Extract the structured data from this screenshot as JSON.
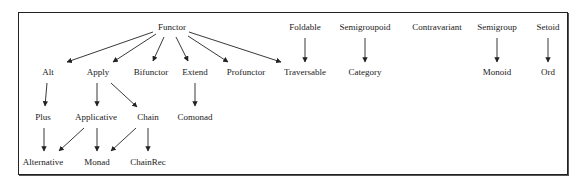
{
  "diagram": {
    "nodes": [
      {
        "id": "Functor",
        "label": "Functor",
        "x": 172,
        "y": 27
      },
      {
        "id": "Alt",
        "label": "Alt",
        "x": 48,
        "y": 72
      },
      {
        "id": "Apply",
        "label": "Apply",
        "x": 98,
        "y": 72
      },
      {
        "id": "Bifunctor",
        "label": "Bifunctor",
        "x": 151,
        "y": 72
      },
      {
        "id": "Extend",
        "label": "Extend",
        "x": 195,
        "y": 72
      },
      {
        "id": "Profunctor",
        "label": "Profunctor",
        "x": 246,
        "y": 72
      },
      {
        "id": "Traversable",
        "label": "Traversable",
        "x": 305,
        "y": 72
      },
      {
        "id": "Foldable",
        "label": "Foldable",
        "x": 305,
        "y": 27
      },
      {
        "id": "Semigroupoid",
        "label": "Semigroupoid",
        "x": 365,
        "y": 27
      },
      {
        "id": "Contravariant",
        "label": "Contravariant",
        "x": 437,
        "y": 27
      },
      {
        "id": "Semigroup",
        "label": "Semigroup",
        "x": 497,
        "y": 27
      },
      {
        "id": "Setoid",
        "label": "Setoid",
        "x": 548,
        "y": 27
      },
      {
        "id": "Category",
        "label": "Category",
        "x": 365,
        "y": 72
      },
      {
        "id": "Monoid",
        "label": "Monoid",
        "x": 497,
        "y": 72
      },
      {
        "id": "Ord",
        "label": "Ord",
        "x": 548,
        "y": 72
      },
      {
        "id": "Plus",
        "label": "Plus",
        "x": 43,
        "y": 117
      },
      {
        "id": "Applicative",
        "label": "Applicative",
        "x": 96,
        "y": 117
      },
      {
        "id": "Chain",
        "label": "Chain",
        "x": 148,
        "y": 117
      },
      {
        "id": "Comonad",
        "label": "Comonad",
        "x": 195,
        "y": 117
      },
      {
        "id": "Alternative",
        "label": "Alternative",
        "x": 43,
        "y": 162
      },
      {
        "id": "Monad",
        "label": "Monad",
        "x": 97,
        "y": 162
      },
      {
        "id": "ChainRec",
        "label": "ChainRec",
        "x": 148,
        "y": 162
      }
    ],
    "edges": [
      {
        "from": "Functor",
        "to": "Alt",
        "x1": 153,
        "y1": 32,
        "x2": 67,
        "y2": 62
      },
      {
        "from": "Functor",
        "to": "Apply",
        "x1": 156,
        "y1": 34,
        "x2": 113,
        "y2": 62
      },
      {
        "from": "Functor",
        "to": "Bifunctor",
        "x1": 164,
        "y1": 37,
        "x2": 153,
        "y2": 61
      },
      {
        "from": "Functor",
        "to": "Extend",
        "x1": 176,
        "y1": 37,
        "x2": 188,
        "y2": 61
      },
      {
        "from": "Functor",
        "to": "Profunctor",
        "x1": 188,
        "y1": 36,
        "x2": 228,
        "y2": 62
      },
      {
        "from": "Functor",
        "to": "Traversable",
        "x1": 189,
        "y1": 32,
        "x2": 281,
        "y2": 62
      },
      {
        "from": "Foldable",
        "to": "Traversable",
        "x1": 305,
        "y1": 38,
        "x2": 305,
        "y2": 62
      },
      {
        "from": "Semigroupoid",
        "to": "Category",
        "x1": 365,
        "y1": 38,
        "x2": 365,
        "y2": 62
      },
      {
        "from": "Semigroup",
        "to": "Monoid",
        "x1": 497,
        "y1": 38,
        "x2": 497,
        "y2": 62
      },
      {
        "from": "Setoid",
        "to": "Ord",
        "x1": 548,
        "y1": 38,
        "x2": 548,
        "y2": 62
      },
      {
        "from": "Alt",
        "to": "Plus",
        "x1": 47,
        "y1": 83,
        "x2": 45,
        "y2": 106
      },
      {
        "from": "Apply",
        "to": "Applicative",
        "x1": 97,
        "y1": 83,
        "x2": 97,
        "y2": 106
      },
      {
        "from": "Apply",
        "to": "Chain",
        "x1": 111,
        "y1": 83,
        "x2": 137,
        "y2": 107
      },
      {
        "from": "Extend",
        "to": "Comonad",
        "x1": 195,
        "y1": 83,
        "x2": 195,
        "y2": 106
      },
      {
        "from": "Plus",
        "to": "Alternative",
        "x1": 44,
        "y1": 128,
        "x2": 44,
        "y2": 151
      },
      {
        "from": "Applicative",
        "to": "Alternative",
        "x1": 84,
        "y1": 128,
        "x2": 59,
        "y2": 151
      },
      {
        "from": "Applicative",
        "to": "Monad",
        "x1": 97,
        "y1": 128,
        "x2": 97,
        "y2": 151
      },
      {
        "from": "Chain",
        "to": "Monad",
        "x1": 136,
        "y1": 128,
        "x2": 111,
        "y2": 151
      },
      {
        "from": "Chain",
        "to": "ChainRec",
        "x1": 148,
        "y1": 128,
        "x2": 148,
        "y2": 151
      }
    ],
    "colors": {
      "line": "#222222",
      "text": "#222222",
      "border": "#222222",
      "background": "#ffffff"
    }
  }
}
